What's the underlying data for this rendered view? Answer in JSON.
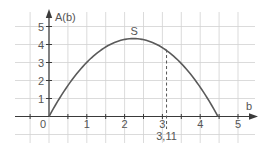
{
  "chart_data": {
    "type": "line",
    "title": "",
    "xlabel": "b",
    "ylabel": "A(b)",
    "xlim": [
      -0.5,
      5.2
    ],
    "ylim": [
      -1,
      5
    ],
    "grid": true,
    "x_ticks": [
      {
        "value": 0,
        "label": "0"
      },
      {
        "value": 1,
        "label": "1"
      },
      {
        "value": 2,
        "label": "2"
      },
      {
        "value": 3,
        "label": "3"
      },
      {
        "value": 4,
        "label": "4"
      },
      {
        "value": 5,
        "label": "5"
      }
    ],
    "y_ticks": [
      {
        "value": 1,
        "label": "1"
      },
      {
        "value": 2,
        "label": "2"
      },
      {
        "value": 3,
        "label": "3"
      },
      {
        "value": 4,
        "label": "4"
      },
      {
        "value": 5,
        "label": "5"
      }
    ],
    "series": [
      {
        "name": "A(b)",
        "x": [
          0,
          0.5,
          1,
          1.5,
          2,
          2.25,
          2.5,
          3,
          3.11,
          3.5,
          4,
          4.47
        ],
        "values": [
          0,
          1.71,
          3.0,
          3.84,
          4.29,
          4.33,
          4.3,
          3.87,
          3.72,
          2.99,
          1.62,
          0
        ]
      }
    ],
    "annotations": [
      {
        "type": "point",
        "label": "S",
        "x": 2.25,
        "y": 4.33
      },
      {
        "type": "vline-dashed",
        "label": "3,11",
        "x": 3.11,
        "y_top": 3.72
      }
    ]
  },
  "labels": {
    "x_axis": "b",
    "y_axis": "A(b)",
    "vertex": "S",
    "marker": "3,11"
  },
  "colors": {
    "curve": "#5a5a5a",
    "grid": "#d2d2d2",
    "axis": "#3a3a3a",
    "text": "#555555"
  }
}
